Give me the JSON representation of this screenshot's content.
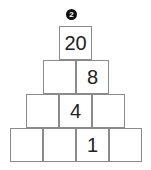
{
  "problem_number": "2",
  "pyramid": {
    "rows": [
      [
        "20"
      ],
      [
        "",
        "8"
      ],
      [
        "",
        "4",
        ""
      ],
      [
        "",
        "",
        "1",
        ""
      ]
    ]
  }
}
